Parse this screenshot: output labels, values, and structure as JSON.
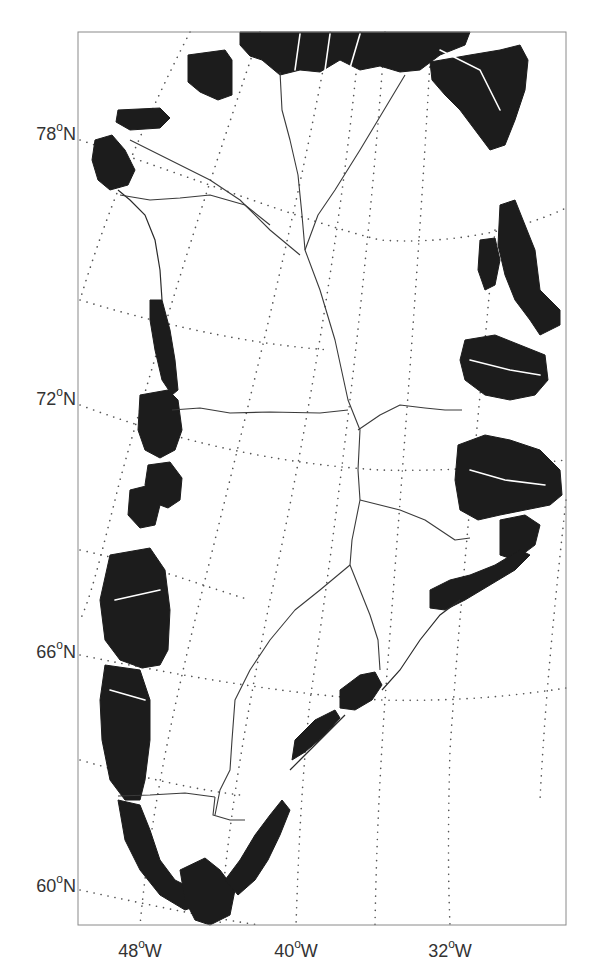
{
  "map": {
    "title": "",
    "projection": "polar stereographic (Greenland)",
    "frame": {
      "left": 78,
      "top": 32,
      "right": 566,
      "bottom": 925
    },
    "colors": {
      "land": "#1c1c1c",
      "ice": "#ffffff",
      "graticule": "#555555",
      "divides": "#3a3a3a",
      "frame": "#8a8a8a",
      "labels": "#333333"
    },
    "latitude_labels": [
      {
        "value": "78",
        "deg": "o",
        "hemi": "N",
        "y": 133
      },
      {
        "value": "72",
        "deg": "o",
        "hemi": "N",
        "y": 398
      },
      {
        "value": "66",
        "deg": "o",
        "hemi": "N",
        "y": 651
      },
      {
        "value": "60",
        "deg": "o",
        "hemi": "N",
        "y": 885
      }
    ],
    "longitude_labels": [
      {
        "value": "48",
        "deg": "o",
        "hemi": "W",
        "x": 140
      },
      {
        "value": "40",
        "deg": "o",
        "hemi": "W",
        "x": 296
      },
      {
        "value": "32",
        "deg": "o",
        "hemi": "W",
        "x": 450
      }
    ],
    "features": {
      "ice_free_land": "black filled coastal margins",
      "ice_sheet": "white interior",
      "drainage_divides": "thin solid lines across ice sheet"
    }
  }
}
